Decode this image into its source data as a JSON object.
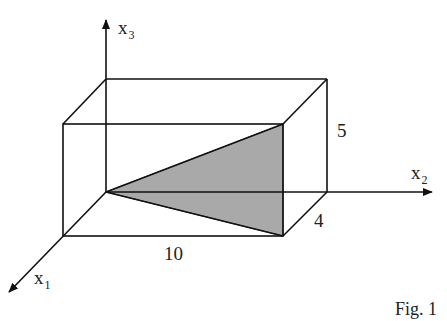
{
  "figure": {
    "caption": "Fig. 1",
    "axes": {
      "x1": {
        "label": "x",
        "sub": "1"
      },
      "x2": {
        "label": "x",
        "sub": "2"
      },
      "x3": {
        "label": "x",
        "sub": "3"
      }
    },
    "dimensions": {
      "length_x2": "10",
      "depth_x1": "4",
      "height_x3": "5"
    },
    "colors": {
      "stroke": "#111111",
      "triangle_fill": "#a9a9a9"
    }
  }
}
